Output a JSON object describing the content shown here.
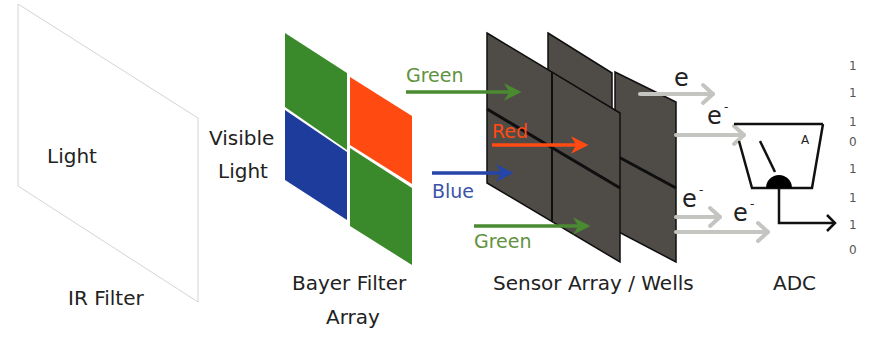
{
  "diagram": {
    "ir_filter": {
      "label": "IR Filter",
      "input_label": "Light",
      "border_color": "#d9d9d9"
    },
    "visible_light": {
      "line1": "Visible",
      "line2": "Light"
    },
    "bayer": {
      "label_line1": "Bayer Filter",
      "label_line2": "Array",
      "cells": [
        {
          "position": "top-left",
          "color": "#3a8a2c",
          "name": "green"
        },
        {
          "position": "top-right",
          "color": "#ff4a12",
          "name": "red"
        },
        {
          "position": "bottom-left",
          "color": "#1d3c9c",
          "name": "blue"
        },
        {
          "position": "bottom-right",
          "color": "#3a8a2c",
          "name": "green"
        }
      ]
    },
    "channels": [
      {
        "label": "Green",
        "color": "#4a8a30",
        "text_color": "#5f9340"
      },
      {
        "label": "Red",
        "color": "#ff4a12",
        "text_color": "#ff4a12"
      },
      {
        "label": "Blue",
        "color": "#2545a8",
        "text_color": "#3a55a8"
      },
      {
        "label": "Green",
        "color": "#4a8a30",
        "text_color": "#5f9340"
      }
    ],
    "sensor": {
      "label": "Sensor Array / Wells",
      "panel_color": "#4f4c48",
      "edge_color": "#0f0f0f"
    },
    "electrons": [
      {
        "symbol": "e",
        "superscript": ""
      },
      {
        "symbol": "e",
        "superscript": "-"
      },
      {
        "symbol": "e",
        "superscript": "-"
      },
      {
        "symbol": "e",
        "superscript": "-"
      }
    ],
    "electron_arrow_color": "#c4c4c0",
    "adc": {
      "label": "ADC",
      "meter_label": "A"
    },
    "bits": [
      "1",
      "1",
      "1",
      "0",
      "1",
      "1",
      "1",
      "0"
    ]
  }
}
